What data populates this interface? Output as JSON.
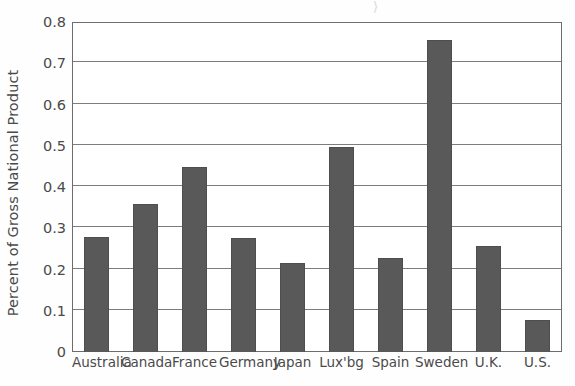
{
  "chart_data": {
    "type": "bar",
    "title": "",
    "xlabel": "",
    "ylabel": "Percent of Gross National Product",
    "categories": [
      "Australia",
      "Canada",
      "France",
      "Germany",
      "Japan",
      "Lux'bg",
      "Spain",
      "Sweden",
      "U.K.",
      "U.S."
    ],
    "values": [
      0.278,
      0.36,
      0.449,
      0.277,
      0.215,
      0.498,
      0.228,
      0.757,
      0.257,
      0.077
    ],
    "ylim": [
      0,
      0.8
    ],
    "ytick_labels": [
      "0",
      "0.1",
      "0.2",
      "0.3",
      "0.4",
      "0.5",
      "0.6",
      "0.7",
      "0.8"
    ],
    "ytick_values": [
      0,
      0.1,
      0.2,
      0.3,
      0.4,
      0.5,
      0.6,
      0.7,
      0.8
    ],
    "grid": "horizontal",
    "legend": "none",
    "bar_color": "#595959",
    "axis_color": "#6d6d6d",
    "grid_color": "#7d7d7d",
    "text_color": "#4a4a4a",
    "background": "#ffffff"
  },
  "artifacts": {
    "top_scan_mark": "⟩"
  }
}
